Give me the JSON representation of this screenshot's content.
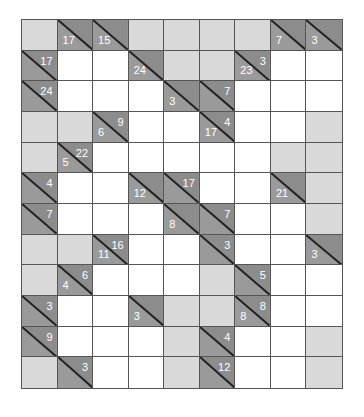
{
  "puzzle": {
    "type": "kakuro",
    "cols": 9,
    "rows": 12,
    "colors": {
      "white": "#ffffff",
      "block": "#d9d9d9",
      "clue": "#9a9a9a",
      "line": "#555555",
      "text": "#ffffff"
    },
    "grid": [
      [
        {
          "t": "B"
        },
        {
          "t": "C",
          "d": "17"
        },
        {
          "t": "C",
          "d": "15"
        },
        {
          "t": "B"
        },
        {
          "t": "B"
        },
        {
          "t": "B"
        },
        {
          "t": "B"
        },
        {
          "t": "C",
          "d": "7"
        },
        {
          "t": "C",
          "d": "3"
        }
      ],
      [
        {
          "t": "C",
          "a": "17"
        },
        {
          "t": "W"
        },
        {
          "t": "W"
        },
        {
          "t": "C",
          "d": "24"
        },
        {
          "t": "B"
        },
        {
          "t": "B"
        },
        {
          "t": "C",
          "d": "23",
          "a": "3"
        },
        {
          "t": "W"
        },
        {
          "t": "W"
        }
      ],
      [
        {
          "t": "C",
          "a": "24"
        },
        {
          "t": "W"
        },
        {
          "t": "W"
        },
        {
          "t": "W"
        },
        {
          "t": "C",
          "d": "3"
        },
        {
          "t": "C",
          "a": "7"
        },
        {
          "t": "W"
        },
        {
          "t": "W"
        },
        {
          "t": "W"
        }
      ],
      [
        {
          "t": "B"
        },
        {
          "t": "B"
        },
        {
          "t": "C",
          "d": "6",
          "a": "9"
        },
        {
          "t": "W"
        },
        {
          "t": "W"
        },
        {
          "t": "C",
          "d": "17",
          "a": "4"
        },
        {
          "t": "W"
        },
        {
          "t": "W"
        },
        {
          "t": "B"
        }
      ],
      [
        {
          "t": "B"
        },
        {
          "t": "C",
          "d": "5",
          "a": "22"
        },
        {
          "t": "W"
        },
        {
          "t": "W"
        },
        {
          "t": "W"
        },
        {
          "t": "W"
        },
        {
          "t": "W"
        },
        {
          "t": "B"
        },
        {
          "t": "B"
        }
      ],
      [
        {
          "t": "C",
          "a": "4"
        },
        {
          "t": "W"
        },
        {
          "t": "W"
        },
        {
          "t": "C",
          "d": "12"
        },
        {
          "t": "C",
          "a": "17"
        },
        {
          "t": "W"
        },
        {
          "t": "W"
        },
        {
          "t": "C",
          "d": "21"
        },
        {
          "t": "B"
        }
      ],
      [
        {
          "t": "C",
          "a": "7"
        },
        {
          "t": "W"
        },
        {
          "t": "W"
        },
        {
          "t": "W"
        },
        {
          "t": "C",
          "d": "8"
        },
        {
          "t": "C",
          "a": "7"
        },
        {
          "t": "W"
        },
        {
          "t": "W"
        },
        {
          "t": "B"
        }
      ],
      [
        {
          "t": "B"
        },
        {
          "t": "B"
        },
        {
          "t": "C",
          "d": "11",
          "a": "16"
        },
        {
          "t": "W"
        },
        {
          "t": "W"
        },
        {
          "t": "C",
          "a": "3"
        },
        {
          "t": "W"
        },
        {
          "t": "W"
        },
        {
          "t": "C",
          "d": "3"
        }
      ],
      [
        {
          "t": "B"
        },
        {
          "t": "C",
          "d": "4",
          "a": "6"
        },
        {
          "t": "W"
        },
        {
          "t": "W"
        },
        {
          "t": "W"
        },
        {
          "t": "B"
        },
        {
          "t": "C",
          "a": "5"
        },
        {
          "t": "W"
        },
        {
          "t": "W"
        }
      ],
      [
        {
          "t": "C",
          "a": "3"
        },
        {
          "t": "W"
        },
        {
          "t": "W"
        },
        {
          "t": "C",
          "d": "3"
        },
        {
          "t": "B"
        },
        {
          "t": "B"
        },
        {
          "t": "C",
          "d": "8",
          "a": "8"
        },
        {
          "t": "W"
        },
        {
          "t": "W"
        }
      ],
      [
        {
          "t": "C",
          "a": "9"
        },
        {
          "t": "W"
        },
        {
          "t": "W"
        },
        {
          "t": "W"
        },
        {
          "t": "B"
        },
        {
          "t": "C",
          "a": "4"
        },
        {
          "t": "W"
        },
        {
          "t": "W"
        },
        {
          "t": "B"
        }
      ],
      [
        {
          "t": "B"
        },
        {
          "t": "C",
          "a": "3"
        },
        {
          "t": "W"
        },
        {
          "t": "W"
        },
        {
          "t": "B"
        },
        {
          "t": "C",
          "a": "12"
        },
        {
          "t": "W"
        },
        {
          "t": "W"
        },
        {
          "t": "B"
        }
      ]
    ]
  }
}
